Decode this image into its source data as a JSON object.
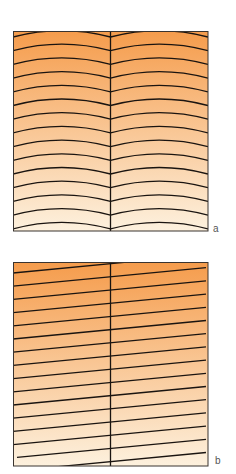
{
  "figure": {
    "panels": [
      {
        "id": "a",
        "label": "a",
        "pattern": "arched-contours",
        "description": "Two adjacent cells divided by a vertical line, each filled with stacked downward-arching (cap-shaped) contour lines",
        "line_count": 15,
        "gradient": {
          "top": "#f59c4c",
          "bottom": "#fdf1de"
        }
      },
      {
        "id": "b",
        "label": "b",
        "pattern": "inclined-contours",
        "description": "Two adjacent cells divided by a vertical line, filled with parallel straight lines inclined upward to the right",
        "line_count": 15,
        "gradient": {
          "top": "#f59c4c",
          "bottom": "#fdf1de"
        }
      }
    ],
    "colors": {
      "line": "#1a1410",
      "border": "#3a3430",
      "label": "#555555"
    }
  }
}
